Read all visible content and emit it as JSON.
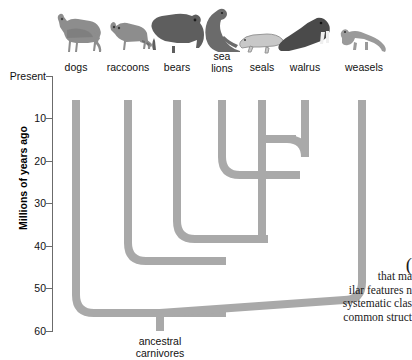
{
  "figure": {
    "axis": {
      "title": "Millions of years ago",
      "ticks": [
        {
          "label": "Present",
          "value": 0
        },
        {
          "label": "10",
          "value": 10
        },
        {
          "label": "20",
          "value": 20
        },
        {
          "label": "30",
          "value": 30
        },
        {
          "label": "40",
          "value": 40
        },
        {
          "label": "50",
          "value": 50
        },
        {
          "label": "60",
          "value": 60
        }
      ]
    },
    "root_label": "ancestral\ncarnivores",
    "tips": [
      {
        "label": "dogs",
        "animal": "dog-silhouette",
        "x": 76
      },
      {
        "label": "raccoons",
        "animal": "raccoon-silhouette",
        "x": 128
      },
      {
        "label": "bears",
        "animal": "bear-silhouette",
        "x": 177
      },
      {
        "label": "sea\nlions",
        "animal": "sea-lion-silhouette",
        "x": 222
      },
      {
        "label": "seals",
        "animal": "seal-silhouette",
        "x": 262
      },
      {
        "label": "walrus",
        "animal": "walrus-silhouette",
        "x": 305
      },
      {
        "label": "weasels",
        "animal": "weasel-silhouette",
        "x": 362
      }
    ],
    "branch_color": "#a9a9a9",
    "nodes": [
      {
        "name": "root",
        "age": 60
      },
      {
        "name": "dogs-vs-rest",
        "age": 56
      },
      {
        "name": "weasels-vs-rest",
        "age": 52
      },
      {
        "name": "raccoons-vs-rest",
        "age": 42
      },
      {
        "name": "bears-vs-pinnipeds",
        "age": 38
      },
      {
        "name": "sealions-vs-sealwalrus",
        "age": 22
      },
      {
        "name": "seals-vs-walrus",
        "age": 15
      }
    ]
  },
  "bodytext": {
    "paren": "(",
    "lines": [
      "that ma",
      "ilar features n",
      "systematic clas",
      "common struct"
    ]
  }
}
